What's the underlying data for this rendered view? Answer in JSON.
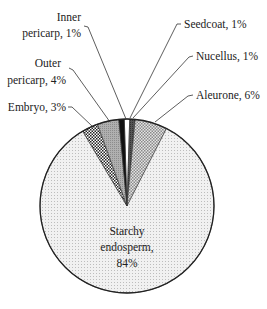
{
  "chart_data": {
    "type": "pie",
    "title": "",
    "start_angle_deg": 0,
    "direction": "clockwise",
    "slices": [
      {
        "name": "Seedcoat",
        "value": 1,
        "label": "Seedcoat, 1%",
        "fill": "white"
      },
      {
        "name": "Nucellus",
        "value": 1,
        "label": "Nucellus, 1%",
        "fill": "dark-grey"
      },
      {
        "name": "Aleurone",
        "value": 6,
        "label": "Aleurone, 6%",
        "fill": "crosshatch"
      },
      {
        "name": "Starchy endosperm",
        "value": 84,
        "label": "Starchy endosperm, 84%",
        "fill": "light-dots"
      },
      {
        "name": "Embryo",
        "value": 3,
        "label": "Embryo, 3%",
        "fill": "dark-checker"
      },
      {
        "name": "Outer pericarp",
        "value": 4,
        "label": "Outer pericarp, 4%",
        "fill": "grey-dots"
      },
      {
        "name": "Inner pericarp",
        "value": 1,
        "label": "Inner pericarp, 1%",
        "fill": "black"
      }
    ],
    "legend": "none (direct labels with leader lines)"
  },
  "labels": {
    "inner_pericarp": [
      "Inner",
      "pericarp, 1%"
    ],
    "outer_pericarp": [
      "Outer",
      "pericarp, 4%"
    ],
    "embryo": "Embryo, 3%",
    "seedcoat": "Seedcoat, 1%",
    "nucellus": "Nucellus, 1%",
    "aleurone": "Aleurone, 6%",
    "starchy": [
      "Starchy",
      "endosperm,",
      "84%"
    ]
  }
}
